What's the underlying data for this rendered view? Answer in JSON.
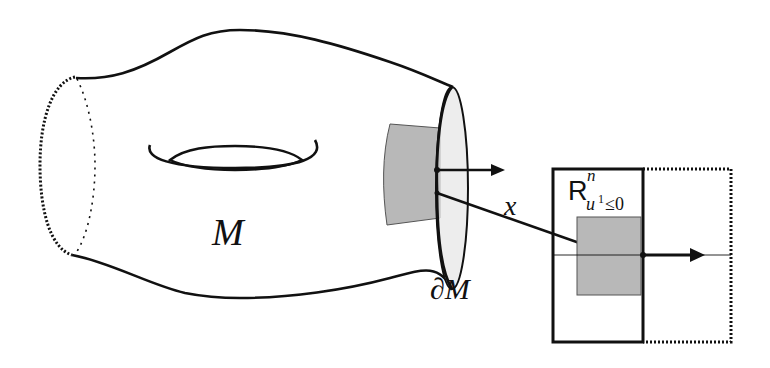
{
  "figure": {
    "labels": {
      "manifold": "M",
      "boundary": "∂M",
      "chart_map": "x",
      "halfspace_base": "R",
      "halfspace_sup": "n",
      "halfspace_sub_var": "u",
      "halfspace_sub_sup": "1",
      "halfspace_sub_rel": "≤0"
    },
    "colors": {
      "stroke": "#111111",
      "patch_fill": "#b8b8b8",
      "rim_fill": "#e6e6e6",
      "background": "#ffffff"
    }
  }
}
